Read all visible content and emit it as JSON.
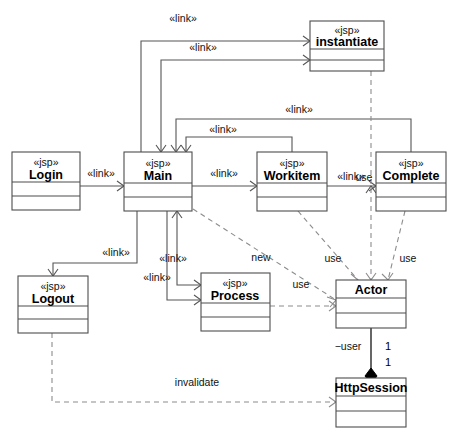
{
  "diagram": {
    "type": "uml-class-diagram",
    "canvas": {
      "width": 449,
      "height": 437
    },
    "colors": {
      "background": "#ffffff",
      "box_stroke": "#4d4d4d",
      "solid_edge": "#555555",
      "dashed_edge": "#8c8c8c",
      "association": "#000000",
      "text": "#000000"
    }
  },
  "classes": [
    {
      "id": "instantiate",
      "stereotype": "«jsp»",
      "name": "instantiate",
      "x": 310,
      "y": 21,
      "w": 74,
      "h": 50,
      "header_h": 28,
      "mid_h": 11
    },
    {
      "id": "login",
      "stereotype": "«jsp»",
      "name": "Login",
      "x": 12,
      "y": 152,
      "w": 68,
      "h": 58,
      "header_h": 30,
      "mid_h": 14
    },
    {
      "id": "main",
      "stereotype": "«jsp»",
      "name": "Main",
      "x": 124,
      "y": 152,
      "w": 68,
      "h": 59,
      "header_h": 31,
      "mid_h": 14
    },
    {
      "id": "workitem",
      "stereotype": "«jsp»",
      "name": "Workitem",
      "x": 257,
      "y": 152,
      "w": 70,
      "h": 59,
      "header_h": 31,
      "mid_h": 14
    },
    {
      "id": "complete",
      "stereotype": "«jsp»",
      "name": "Complete",
      "x": 376,
      "y": 152,
      "w": 70,
      "h": 59,
      "header_h": 31,
      "mid_h": 14
    },
    {
      "id": "logout",
      "stereotype": "«jsp»",
      "name": "Logout",
      "x": 18,
      "y": 276,
      "w": 70,
      "h": 57,
      "header_h": 30,
      "mid_h": 13
    },
    {
      "id": "process",
      "stereotype": "«jsp»",
      "name": "Process",
      "x": 201,
      "y": 273,
      "w": 69,
      "h": 58,
      "header_h": 30,
      "mid_h": 14
    },
    {
      "id": "actor",
      "stereotype": "",
      "name": "Actor",
      "x": 336,
      "y": 280,
      "w": 70,
      "h": 48,
      "header_h": 18,
      "mid_h": 15
    },
    {
      "id": "httpsession",
      "stereotype": "",
      "name": "HttpSession",
      "x": 336,
      "y": 378,
      "w": 70,
      "h": 49,
      "header_h": 18,
      "mid_h": 15
    }
  ],
  "relationships": [
    {
      "id": "login-main",
      "from": "Login",
      "to": "Main",
      "kind": "link",
      "label": "«link»"
    },
    {
      "id": "main-workitem",
      "from": "Main",
      "to": "Workitem",
      "kind": "link",
      "label": "«link»"
    },
    {
      "id": "workitem-complete",
      "from": "Workitem",
      "to": "Complete",
      "kind": "link",
      "label": "«link»"
    },
    {
      "id": "main-instantiate",
      "from": "Main",
      "to": "instantiate",
      "kind": "link",
      "label": "«link»"
    },
    {
      "id": "instantiate-main",
      "from": "instantiate",
      "to": "Main",
      "kind": "link",
      "label": "«link»"
    },
    {
      "id": "complete-main",
      "from": "Complete",
      "to": "Main",
      "kind": "link",
      "label": "«link»"
    },
    {
      "id": "workitem-main",
      "from": "Workitem",
      "to": "Main",
      "kind": "link",
      "label": "«link»"
    },
    {
      "id": "main-logout",
      "from": "Main",
      "to": "Logout",
      "kind": "link",
      "label": "«link»"
    },
    {
      "id": "main-process",
      "from": "Main",
      "to": "Process",
      "kind": "link",
      "label": "«link»"
    },
    {
      "id": "process-main",
      "from": "Process",
      "to": "Main",
      "kind": "link",
      "label": "«link»"
    },
    {
      "id": "main-actor-new",
      "from": "Main",
      "to": "Actor",
      "kind": "dependency",
      "label": "new"
    },
    {
      "id": "workitem-actor-use",
      "from": "Workitem",
      "to": "Actor",
      "kind": "dependency",
      "label": "use"
    },
    {
      "id": "instantiate-actor-use",
      "from": "instantiate",
      "to": "Actor",
      "kind": "dependency",
      "label": "use"
    },
    {
      "id": "complete-actor-use",
      "from": "Complete",
      "to": "Actor",
      "kind": "dependency",
      "label": "use"
    },
    {
      "id": "process-actor-use",
      "from": "Process",
      "to": "Actor",
      "kind": "dependency",
      "label": "use"
    },
    {
      "id": "logout-session",
      "from": "Logout",
      "to": "HttpSession",
      "kind": "dependency",
      "label": "invalidate"
    },
    {
      "id": "actor-session",
      "from": "Actor",
      "to": "HttpSession",
      "kind": "composition",
      "role_label": "−user",
      "mult_source": "1",
      "mult_target": "1"
    }
  ],
  "edge_labels": {
    "link_main_instantiate_top": "«link»",
    "link_instantiate_main": "«link»",
    "link_complete_main": "«link»",
    "link_workitem_main": "«link»",
    "link_login_main": "«link»",
    "link_main_workitem": "«link»",
    "link_workitem_complete": "«link»",
    "link_main_logout": "«link»",
    "link_main_process_a": "«link»",
    "link_main_process_b": "«link»",
    "new": "new",
    "use_workitem": "use",
    "use_instantiate": "use",
    "use_complete": "use",
    "use_process": "use",
    "invalidate": "invalidate",
    "role_user": "−user",
    "mult_top": "1",
    "mult_bottom": "1"
  }
}
